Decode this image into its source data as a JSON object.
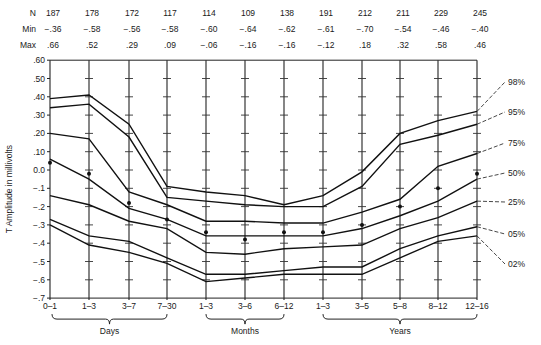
{
  "chart_data": {
    "type": "line",
    "title": "",
    "ylabel": "T Amplitude in millivolts",
    "xlabel": "",
    "ylim": [
      -0.7,
      0.6
    ],
    "yticks": [
      ".60",
      ".50",
      ".40",
      ".30",
      ".20",
      ".10",
      "0.0",
      "−.1",
      "−.2",
      "−.3",
      "−.4",
      "−.5",
      "−.6",
      "−.7"
    ],
    "categories": [
      "0–1",
      "1–3",
      "3–7",
      "7–30",
      "1–3",
      "3–6",
      "6–12",
      "1–3",
      "3–5",
      "5–8",
      "8–12",
      "12–16"
    ],
    "groups": [
      {
        "label": "Days",
        "from": 0,
        "to": 3
      },
      {
        "label": "Months",
        "from": 4,
        "to": 6
      },
      {
        "label": "Years",
        "from": 7,
        "to": 11
      }
    ],
    "header_rows": [
      {
        "label": "N",
        "values": [
          "187",
          "178",
          "172",
          "117",
          "114",
          "109",
          "138",
          "191",
          "212",
          "211",
          "229",
          "245"
        ]
      },
      {
        "label": "Min",
        "values": [
          "−.36",
          "−.58",
          "−.56",
          "−.58",
          "−.60",
          "−.64",
          "−.62",
          "−.61",
          "−.70",
          "−.54",
          "−.46",
          "−.40"
        ]
      },
      {
        "label": "Max",
        "values": [
          ".66",
          ".52",
          ".29",
          ".09",
          "−.06",
          "−.16",
          "−.16",
          "−.12",
          ".18",
          ".32",
          ".58",
          ".46"
        ]
      }
    ],
    "series": [
      {
        "name": "98%",
        "values": [
          0.39,
          0.41,
          0.25,
          -0.09,
          -0.12,
          -0.14,
          -0.19,
          -0.14,
          -0.01,
          0.2,
          0.27,
          0.32
        ]
      },
      {
        "name": "95%",
        "values": [
          0.34,
          0.36,
          0.18,
          -0.15,
          -0.17,
          -0.19,
          -0.2,
          -0.2,
          -0.09,
          0.14,
          0.19,
          0.25
        ]
      },
      {
        "name": "75%",
        "values": [
          0.2,
          0.17,
          -0.12,
          -0.19,
          -0.28,
          -0.28,
          -0.29,
          -0.29,
          -0.23,
          -0.16,
          0.02,
          0.09
        ]
      },
      {
        "name": "50%",
        "values": [
          0.06,
          -0.05,
          -0.21,
          -0.27,
          -0.36,
          -0.36,
          -0.36,
          -0.36,
          -0.32,
          -0.25,
          -0.17,
          -0.05
        ]
      },
      {
        "name": "25%",
        "values": [
          -0.14,
          -0.19,
          -0.28,
          -0.32,
          -0.45,
          -0.46,
          -0.43,
          -0.42,
          -0.41,
          -0.32,
          -0.26,
          -0.17
        ]
      },
      {
        "name": "05%",
        "values": [
          -0.27,
          -0.36,
          -0.39,
          -0.48,
          -0.57,
          -0.57,
          -0.55,
          -0.53,
          -0.53,
          -0.43,
          -0.36,
          -0.31
        ]
      },
      {
        "name": "02%",
        "values": [
          -0.3,
          -0.41,
          -0.45,
          -0.51,
          -0.61,
          -0.59,
          -0.57,
          -0.57,
          -0.57,
          -0.48,
          -0.39,
          -0.36
        ]
      }
    ],
    "means": {
      "name": "mean",
      "values": [
        0.04,
        -0.02,
        -0.18,
        -0.27,
        -0.34,
        -0.38,
        -0.34,
        -0.34,
        -0.3,
        -0.2,
        -0.1,
        -0.02
      ]
    },
    "grid": false,
    "legend_position": "right (line-end labels)"
  }
}
